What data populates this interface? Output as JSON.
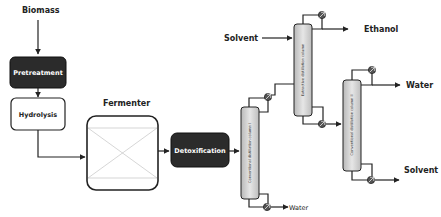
{
  "diagram": {
    "inputs": {
      "biomass": "Biomass",
      "solvent_in": "Solvent"
    },
    "blocks": {
      "pretreatment": "Pretreatment",
      "hydrolysis": "Hydrolysis",
      "fermenter": "Fermenter",
      "detoxification": "Detoxification"
    },
    "columns": {
      "column1": "Conventional distillation column I",
      "extractive": "Extractive distillation column",
      "column2": "Conventional distillation column II"
    },
    "outputs": {
      "ethanol": "Ethanol",
      "water_top": "Water",
      "water_bottom": "Water",
      "solvent_out": "Solvent"
    },
    "colors": {
      "dark_block": "#2b2b2b",
      "light_block": "#ffffff",
      "column_fill": "#cfcfcf",
      "line": "#222222"
    }
  }
}
